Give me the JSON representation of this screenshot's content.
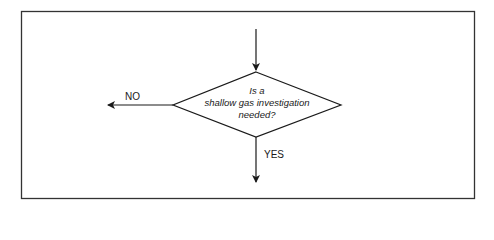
{
  "diagram": {
    "type": "flowchart-decision",
    "decision": {
      "lines": [
        "Is a",
        "shallow gas investigation",
        "needed?"
      ]
    },
    "branches": {
      "no_label": "NO",
      "yes_label": "YES"
    },
    "colors": {
      "stroke": "#1a1a1a",
      "background": "#ffffff"
    }
  }
}
